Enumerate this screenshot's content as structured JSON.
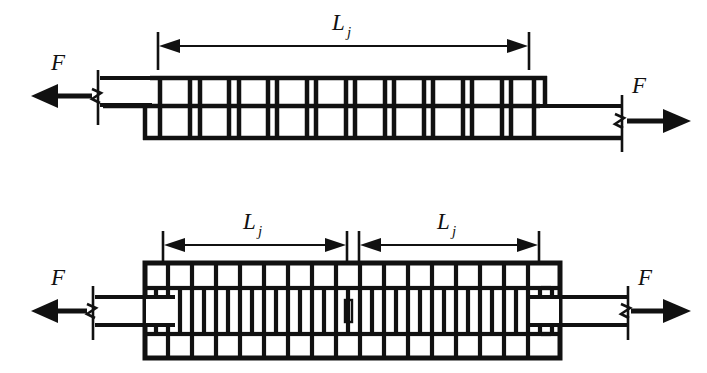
{
  "figure": {
    "background_color": "#ffffff",
    "line_color": "#111111",
    "canvas": {
      "width": 707,
      "height": 373
    }
  },
  "labels": {
    "force": "F",
    "length_symbol": "L",
    "length_subscript": "j"
  },
  "diagrams": [
    {
      "id": "single-lap-joint",
      "name": "top-diagram",
      "dimensions": [
        {
          "label_main": "L",
          "label_sub": "j",
          "x_start": 158,
          "x_end": 528,
          "y": 46
        }
      ],
      "forces": [
        {
          "label": "F",
          "direction": "left",
          "x_tail": 190,
          "x_head": 33,
          "y": 97
        },
        {
          "label": "F",
          "direction": "right",
          "x_tail": 620,
          "x_head": 690,
          "y": 120
        }
      ],
      "ladder": {
        "x_start": 145,
        "x_end": 545,
        "y_top": 78,
        "y_mid": 106,
        "y_bottom": 138,
        "bays": 10
      },
      "plates": [
        {
          "role": "upper-left-plate",
          "x_start": 100,
          "x_end": 158,
          "y_top": 78,
          "y_bottom": 106
        },
        {
          "role": "lower-right-plate",
          "x_start": 535,
          "x_end": 620,
          "y_top": 106,
          "y_bottom": 138
        }
      ]
    },
    {
      "id": "double-lap-joint",
      "name": "bottom-diagram",
      "dimensions": [
        {
          "label_main": "L",
          "label_sub": "j",
          "x_start": 163,
          "x_end": 345,
          "y": 245
        },
        {
          "label_main": "L",
          "label_sub": "j",
          "x_start": 360,
          "x_end": 538,
          "y": 245
        }
      ],
      "forces": [
        {
          "label": "F",
          "direction": "left",
          "x_tail": 190,
          "x_head": 33,
          "y": 310
        },
        {
          "label": "F",
          "direction": "right",
          "x_tail": 620,
          "x_head": 690,
          "y": 310
        }
      ],
      "box": {
        "x_start": 145,
        "x_end": 560,
        "y_top": 263,
        "y_bottom": 358,
        "columns": 34
      },
      "plates": [
        {
          "role": "left-plate",
          "x_start": 95,
          "x_end": 175,
          "y_top": 297,
          "y_bottom": 325
        },
        {
          "role": "right-plate",
          "x_start": 530,
          "x_end": 625,
          "y_top": 297,
          "y_bottom": 325
        }
      ]
    }
  ],
  "annotations": {
    "break_symbol": "zigzag-break",
    "arrowhead_style": "solid-filled-triangle",
    "extension_tick": "vertical-tick"
  }
}
